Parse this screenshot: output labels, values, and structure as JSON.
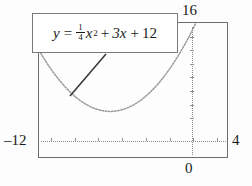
{
  "chart_data": {
    "type": "line",
    "title": "",
    "equation_text": "y = 1/4 x^2 + 3x + 12",
    "equation_parts": {
      "lhs": "y",
      "equals": "=",
      "frac_numerator": "1",
      "frac_denominator": "4",
      "x_base": "x",
      "x_exponent": "2",
      "plus_1": "+",
      "linear_term": "3x",
      "plus_2": "+",
      "constant": "12"
    },
    "xlabel": "",
    "ylabel": "",
    "xlim": [
      -12,
      4
    ],
    "ylim": [
      -4,
      16
    ],
    "grid": false,
    "legend": "none",
    "curve_style": "dotted",
    "x": [
      -12,
      -11,
      -10,
      -9,
      -8,
      -7,
      -6,
      -5,
      -4,
      -3,
      -2,
      -1,
      0,
      1,
      2,
      3,
      4
    ],
    "y": [
      12,
      9.25,
      7,
      5.25,
      4,
      3.25,
      3,
      3.25,
      4,
      5.25,
      7,
      9.25,
      12,
      15.25,
      19,
      23.25,
      28
    ],
    "vertex": [
      -6,
      3
    ],
    "y_intercept": 12,
    "annotations": [
      {
        "name": "equation-callout",
        "text": "y = 1/4 x^2 + 3x + 12",
        "points_to": "curve"
      }
    ]
  },
  "axis_labels": {
    "y_max": "16",
    "x_min": "‒12",
    "x_max": "4",
    "origin": "0"
  },
  "ticks": {
    "x_tick_positions": [
      -11,
      -9,
      -7,
      -5,
      -3,
      -1,
      1,
      3
    ],
    "y_tick_positions": [
      2,
      4,
      6,
      8,
      10,
      12,
      14
    ]
  }
}
